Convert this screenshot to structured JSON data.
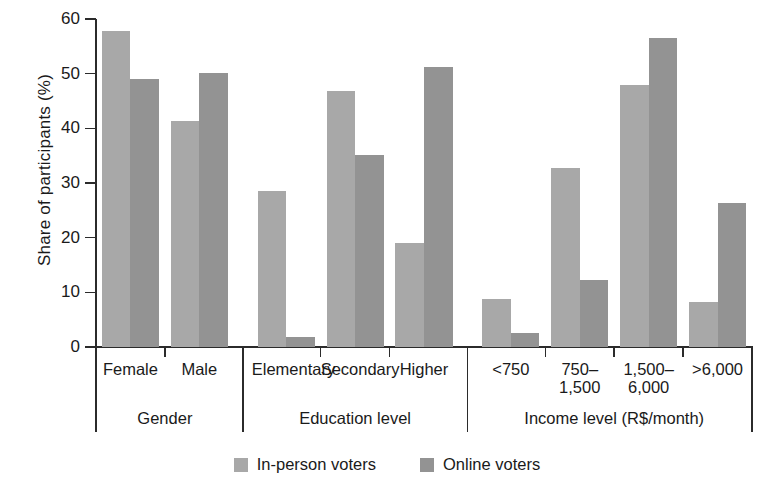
{
  "chart_data": {
    "type": "bar",
    "title": "",
    "xlabel": "",
    "ylabel": "Share of participants (%)",
    "ylim": [
      0,
      60
    ],
    "yticks": [
      0,
      10,
      20,
      30,
      40,
      50,
      60
    ],
    "grid": false,
    "legend_position": "bottom",
    "categories": [
      "Female",
      "Male",
      "Elementary",
      "Secondary",
      "Higher",
      "<750",
      "750–\n1,500",
      "1,500–\n6,000",
      ">6,000"
    ],
    "groups": [
      {
        "label": "Gender",
        "categories": [
          "Female",
          "Male"
        ]
      },
      {
        "label": "Education level",
        "categories": [
          "Elementary",
          "Secondary",
          "Higher"
        ]
      },
      {
        "label": "Income level (R$/month)",
        "categories": [
          "<750",
          "750–\n1,500",
          "1,500–\n6,000",
          ">6,000"
        ]
      }
    ],
    "series": [
      {
        "name": "In-person voters",
        "color": "#a8a8a8",
        "values": [
          57.8,
          41.3,
          28.5,
          46.9,
          19.1,
          8.7,
          32.7,
          48.0,
          8.3
        ]
      },
      {
        "name": "Online voters",
        "color": "#939393",
        "values": [
          49.0,
          50.1,
          1.9,
          35.2,
          51.3,
          2.5,
          12.3,
          56.6,
          26.4
        ]
      }
    ]
  },
  "legend": {
    "items": [
      {
        "label": "In-person voters",
        "color": "#a8a8a8"
      },
      {
        "label": "Online voters",
        "color": "#939393"
      }
    ]
  }
}
